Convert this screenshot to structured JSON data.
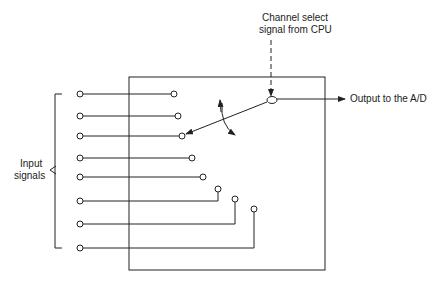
{
  "diagram": {
    "type": "analog multiplexer",
    "labels": {
      "channel_select_line1": "Channel select",
      "channel_select_line2": "signal from CPU",
      "output": "Output to the A/D",
      "inputs_line1": "Input",
      "inputs_line2": "signals"
    },
    "input_count": 8,
    "selected_input": 3,
    "colors": {
      "stroke": "#222222",
      "background": "#ffffff"
    }
  }
}
